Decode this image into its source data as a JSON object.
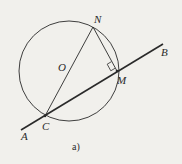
{
  "figure": {
    "caption": "a)",
    "colors": {
      "background": "#f1f0ec",
      "stroke": "#2a2a2a"
    },
    "circle": {
      "center_label": "O",
      "cx": 69,
      "cy": 71,
      "r": 50
    },
    "points": {
      "N": {
        "label": "N",
        "x": 93,
        "y": 27
      },
      "C": {
        "label": "C",
        "x": 45,
        "y": 116
      },
      "M": {
        "label": "M",
        "x": 117,
        "y": 71
      },
      "A": {
        "label": "A"
      },
      "B": {
        "label": "B"
      }
    },
    "line_AB": {
      "x1": 21,
      "y1": 130,
      "x2": 163,
      "y2": 44
    },
    "segments": [
      "NC (diameter)",
      "NM",
      "AB (line)"
    ],
    "right_angle_at": "M"
  }
}
